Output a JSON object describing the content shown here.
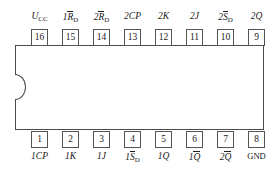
{
  "diagram": {
    "package": "DIP-16",
    "body_color": "#4a4a4a",
    "pin_border_color": "#555555",
    "background": "#ffffff"
  },
  "pins_top": [
    {
      "number": "16",
      "label_pre": "U",
      "label_sub": "CC",
      "label_over": "",
      "label_post": "",
      "plain": "UCC"
    },
    {
      "number": "15",
      "label_pre": "1",
      "label_over": "R",
      "label_sub": "D",
      "label_post": "",
      "plain": "1RD"
    },
    {
      "number": "14",
      "label_pre": "2",
      "label_over": "R",
      "label_sub": "D",
      "label_post": "",
      "plain": "2RD"
    },
    {
      "number": "13",
      "label_pre": "2CP",
      "label_over": "",
      "label_sub": "",
      "label_post": "",
      "plain": "2CP"
    },
    {
      "number": "12",
      "label_pre": "2K",
      "label_over": "",
      "label_sub": "",
      "label_post": "",
      "plain": "2K"
    },
    {
      "number": "11",
      "label_pre": "2J",
      "label_over": "",
      "label_sub": "",
      "label_post": "",
      "plain": "2J"
    },
    {
      "number": "10",
      "label_pre": "2",
      "label_over": "S",
      "label_sub": "D",
      "label_post": "",
      "plain": "2SD"
    },
    {
      "number": "9",
      "label_pre": "2Q",
      "label_over": "",
      "label_sub": "",
      "label_post": "",
      "plain": "2Q"
    }
  ],
  "pins_bottom": [
    {
      "number": "1",
      "label_pre": "1CP",
      "label_over": "",
      "label_sub": "",
      "label_post": "",
      "plain": "1CP"
    },
    {
      "number": "2",
      "label_pre": "1K",
      "label_over": "",
      "label_sub": "",
      "label_post": "",
      "plain": "1K"
    },
    {
      "number": "3",
      "label_pre": "1J",
      "label_over": "",
      "label_sub": "",
      "label_post": "",
      "plain": "1J"
    },
    {
      "number": "4",
      "label_pre": "1",
      "label_over": "S",
      "label_sub": "D",
      "label_post": "",
      "plain": "1SD"
    },
    {
      "number": "5",
      "label_pre": "1Q",
      "label_over": "",
      "label_sub": "",
      "label_post": "",
      "plain": "1Q"
    },
    {
      "number": "6",
      "label_pre": "1",
      "label_over": "Q",
      "label_sub": "",
      "label_post": "",
      "plain": "1Q-bar"
    },
    {
      "number": "7",
      "label_pre": "2",
      "label_over": "Q",
      "label_sub": "",
      "label_post": "",
      "plain": "2Q-bar"
    },
    {
      "number": "8",
      "label_pre": "GND",
      "label_over": "",
      "label_sub": "",
      "label_post": "",
      "plain": "GND",
      "upright": true
    }
  ]
}
